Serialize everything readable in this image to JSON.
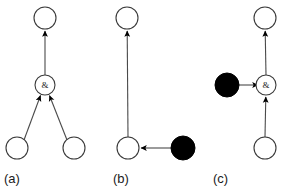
{
  "figure": {
    "background_color": "#ffffff",
    "stroke_color": "#4a4a4a",
    "fill_open": "#ffffff",
    "fill_marked": "#000000",
    "panels": [
      {
        "id": "a",
        "label": "(a)",
        "label_x": 4,
        "label_y": 183,
        "gate_symbol": "&",
        "nodes": [
          {
            "name": "top-place",
            "kind": "open",
            "cx": 45,
            "cy": 18,
            "r": 11
          },
          {
            "name": "and-gate",
            "kind": "gate",
            "cx": 45,
            "cy": 85,
            "r": 10,
            "text": "&"
          },
          {
            "name": "bottom-left-place",
            "kind": "open",
            "cx": 17,
            "cy": 148,
            "r": 11
          },
          {
            "name": "bottom-right-place",
            "kind": "open",
            "cx": 74,
            "cy": 148,
            "r": 11
          }
        ],
        "edges": [
          {
            "name": "gate-to-top",
            "from": "and-gate",
            "to": "top-place",
            "x1": 45,
            "y1": 75,
            "x2": 45,
            "y2": 29
          },
          {
            "name": "bottom-left-to-gate",
            "from": "bottom-left-place",
            "to": "and-gate",
            "x1": 24,
            "y1": 140,
            "x2": 40,
            "y2": 94
          },
          {
            "name": "bottom-right-to-gate",
            "from": "bottom-right-place",
            "to": "and-gate",
            "x1": 67,
            "y1": 140,
            "x2": 50,
            "y2": 94
          }
        ]
      },
      {
        "id": "b",
        "label": "(b)",
        "label_x": 113,
        "label_y": 183,
        "gate_symbol": "",
        "nodes": [
          {
            "name": "top-place",
            "kind": "open",
            "cx": 127,
            "cy": 18,
            "r": 11
          },
          {
            "name": "bottom-place",
            "kind": "open",
            "cx": 128,
            "cy": 148,
            "r": 11
          },
          {
            "name": "marked-place",
            "kind": "marked",
            "cx": 183,
            "cy": 148,
            "r": 12
          }
        ],
        "edges": [
          {
            "name": "bottom-to-top",
            "from": "bottom-place",
            "to": "top-place",
            "x1": 128,
            "y1": 137,
            "x2": 127,
            "y2": 29
          },
          {
            "name": "marked-to-bottom",
            "from": "marked-place",
            "to": "bottom-place",
            "x1": 171,
            "y1": 148,
            "x2": 139,
            "y2": 148
          }
        ]
      },
      {
        "id": "c",
        "label": "(c)",
        "label_x": 213,
        "label_y": 183,
        "gate_symbol": "&",
        "nodes": [
          {
            "name": "top-place",
            "kind": "open",
            "cx": 265,
            "cy": 18,
            "r": 11
          },
          {
            "name": "and-gate",
            "kind": "gate",
            "cx": 266,
            "cy": 85,
            "r": 10,
            "text": "&"
          },
          {
            "name": "marked-place",
            "kind": "marked",
            "cx": 227,
            "cy": 85,
            "r": 12
          },
          {
            "name": "bottom-place",
            "kind": "open",
            "cx": 265,
            "cy": 148,
            "r": 11
          }
        ],
        "edges": [
          {
            "name": "gate-to-top",
            "from": "and-gate",
            "to": "top-place",
            "x1": 266,
            "y1": 75,
            "x2": 265,
            "y2": 29
          },
          {
            "name": "marked-to-gate",
            "from": "marked-place",
            "to": "and-gate",
            "x1": 239,
            "y1": 85,
            "x2": 256,
            "y2": 85
          },
          {
            "name": "bottom-to-gate",
            "from": "bottom-place",
            "to": "and-gate",
            "x1": 265,
            "y1": 137,
            "x2": 266,
            "y2": 95
          }
        ]
      }
    ]
  }
}
